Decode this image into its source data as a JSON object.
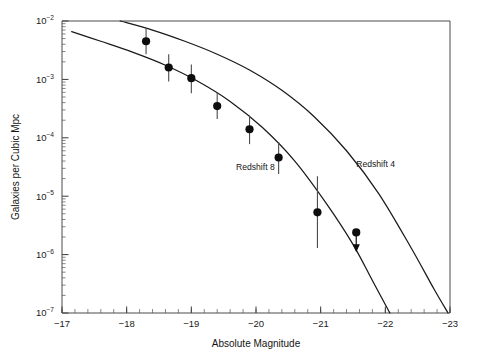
{
  "figure": {
    "background_color": "#ffffff",
    "ink_color": "#1a1a1a",
    "width": 479,
    "height": 363
  },
  "chart_data": {
    "type": "scatter",
    "title": "",
    "subtitle": "",
    "xlabel": "Absolute Magnitude",
    "ylabel": "Galaxies per Cubic Mpc",
    "xlim": [
      -17,
      -23
    ],
    "ylim": [
      1e-07,
      0.01
    ],
    "xscale": "linear",
    "yscale": "log",
    "x_inverted": true,
    "grid": false,
    "legend_position": "inline-annotation",
    "x_ticks": [
      -17,
      -18,
      -19,
      -20,
      -21,
      -22,
      -23
    ],
    "x_tick_labels": [
      "−17",
      "−18",
      "−19",
      "−20",
      "−21",
      "−22",
      "−23"
    ],
    "x_minor_tick_step": 0.2,
    "y_ticks": [
      0.01,
      0.001,
      0.0001,
      1e-05,
      1e-06,
      1e-07
    ],
    "y_tick_mantissa": "10",
    "y_tick_exponents": [
      "−2",
      "−3",
      "−4",
      "−5",
      "−6",
      "−7"
    ],
    "annotations": [
      {
        "text": "Redshift 8",
        "x": -19.99,
        "y": 2.76e-05,
        "name": "redshift-8-label"
      },
      {
        "text": "Redshift 4",
        "x": -21.85,
        "y": 3.18e-05,
        "name": "redshift-4-label"
      }
    ],
    "series": [
      {
        "name": "Redshift 8",
        "kind": "scatter-with-errorbars",
        "marker": "filled-circle",
        "marker_color": "#0d0d0d",
        "points": [
          {
            "x": -18.3,
            "y": 0.0045,
            "y_err_low": 0.0027,
            "y_err_high": 0.0076
          },
          {
            "x": -18.65,
            "y": 0.0016,
            "y_err_low": 0.00092,
            "y_err_high": 0.0027
          },
          {
            "x": -19.0,
            "y": 0.00105,
            "y_err_low": 0.00058,
            "y_err_high": 0.0018
          },
          {
            "x": -19.4,
            "y": 0.00035,
            "y_err_low": 0.00021,
            "y_err_high": 0.00059
          },
          {
            "x": -19.9,
            "y": 0.00014,
            "y_err_low": 7.8e-05,
            "y_err_high": 0.00024
          },
          {
            "x": -20.35,
            "y": 4.6e-05,
            "y_err_low": 2.4e-05,
            "y_err_high": 8.5e-05
          },
          {
            "x": -20.95,
            "y": 5.3e-06,
            "y_err_low": 1.3e-06,
            "y_err_high": 2.2e-05
          }
        ],
        "upper_limits": [
          {
            "x": -21.55,
            "y": 2.4e-06
          }
        ]
      },
      {
        "name": "Redshift 8 model",
        "kind": "line",
        "curve": [
          {
            "x": -17.15,
            "y": 0.0066
          },
          {
            "x": -17.6,
            "y": 0.0045
          },
          {
            "x": -18.1,
            "y": 0.0029
          },
          {
            "x": -18.6,
            "y": 0.00175
          },
          {
            "x": -19.1,
            "y": 0.00093
          },
          {
            "x": -19.6,
            "y": 0.00042
          },
          {
            "x": -20.1,
            "y": 0.00015
          },
          {
            "x": -20.6,
            "y": 4e-05
          },
          {
            "x": -21.1,
            "y": 7.2e-06
          },
          {
            "x": -21.5,
            "y": 1.5e-06
          },
          {
            "x": -21.8,
            "y": 3.6e-07
          },
          {
            "x": -22.07,
            "y": 1e-07
          }
        ]
      },
      {
        "name": "Redshift 4 model",
        "kind": "line",
        "curve": [
          {
            "x": -17.9,
            "y": 0.01
          },
          {
            "x": -18.4,
            "y": 0.007
          },
          {
            "x": -18.9,
            "y": 0.0045
          },
          {
            "x": -19.4,
            "y": 0.0027
          },
          {
            "x": -19.9,
            "y": 0.00145
          },
          {
            "x": -20.4,
            "y": 0.00065
          },
          {
            "x": -20.9,
            "y": 0.00023
          },
          {
            "x": -21.4,
            "y": 6e-05
          },
          {
            "x": -21.9,
            "y": 1.1e-05
          },
          {
            "x": -22.4,
            "y": 1.3e-06
          },
          {
            "x": -22.75,
            "y": 2.6e-07
          },
          {
            "x": -22.97,
            "y": 1e-07
          }
        ]
      }
    ]
  }
}
